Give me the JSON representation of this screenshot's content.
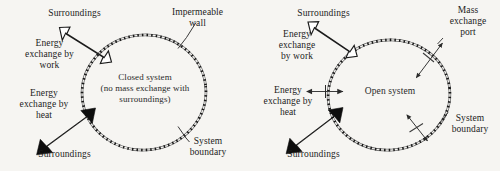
{
  "figure": {
    "background_color": "#f6f5f2",
    "ink_color": "#1a1a1a",
    "boundary_style": "dashed-double-line ellipse",
    "panels": [
      {
        "id": "closed-system",
        "system_label": "Closed system\n(no mass exchange with\nsurroundings)",
        "labels": {
          "surroundings_top": "Surroundings",
          "surroundings_bottom": "Surroundings",
          "work": "Energy\nexchange by\nwork",
          "heat": "Energy\nexchange by\nheat",
          "wall": "Impermeable\nwall",
          "boundary": "System\nboundary"
        },
        "arrows": {
          "work": {
            "style": "hollow-double-headed",
            "fill": "#ffffff",
            "stroke": "#1a1a1a"
          },
          "heat": {
            "style": "solid-double-headed",
            "fill": "#0d0d0d"
          }
        }
      },
      {
        "id": "open-system",
        "system_label": "Open system",
        "labels": {
          "surroundings_top": "Surroundings",
          "surroundings_bottom": "Surroundings",
          "work": "Energy\nexchange\nby work",
          "heat": "Energy\nexchange by\nheat",
          "mass_port": "Mass\nexchange\nport",
          "boundary": "System\nboundary"
        },
        "arrows": {
          "work": {
            "style": "hollow-double-headed",
            "fill": "#ffffff",
            "stroke": "#1a1a1a"
          },
          "heat": {
            "style": "solid-double-headed",
            "fill": "#0d0d0d"
          },
          "mass_ports": [
            {
              "position": "upper-right",
              "style": "thin-double-headed"
            },
            {
              "position": "left-middle",
              "style": "thin-double-headed"
            },
            {
              "position": "lower-right",
              "style": "thin-double-headed"
            }
          ]
        }
      }
    ]
  }
}
